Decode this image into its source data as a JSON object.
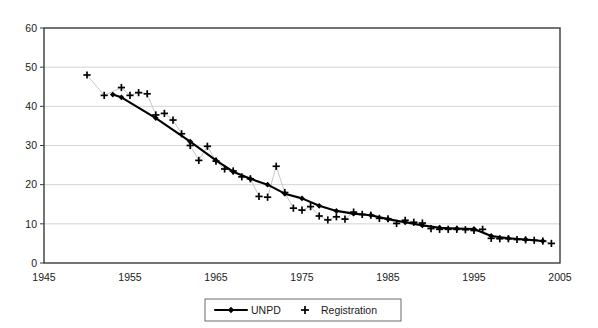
{
  "chart_data": {
    "type": "line",
    "title": "",
    "subtitle": "",
    "xlabel": "",
    "ylabel": "",
    "xlim": [
      1945,
      2005
    ],
    "ylim": [
      0,
      60
    ],
    "xticks": [
      1945,
      1955,
      1965,
      1975,
      1985,
      1995,
      2005
    ],
    "yticks": [
      0,
      10,
      20,
      30,
      40,
      50,
      60
    ],
    "grid": "horizontal",
    "legend_position": "bottom-center",
    "series": [
      {
        "name": "UNPD",
        "marker": "diamond",
        "line": "solid-black",
        "x": [
          1953,
          1954,
          1958,
          1962,
          1965,
          1967,
          1969,
          1971,
          1973,
          1975,
          1977,
          1979,
          1981,
          1983,
          1985,
          1987,
          1989,
          1991,
          1993,
          1995,
          1997,
          1999,
          2001,
          2003
        ],
        "values": [
          43.0,
          42.3,
          37.0,
          31.0,
          26.2,
          23.3,
          21.5,
          20.0,
          17.7,
          16.5,
          14.6,
          13.3,
          12.6,
          12.2,
          11.2,
          10.4,
          9.6,
          9.0,
          8.8,
          8.7,
          6.9,
          6.3,
          6.0,
          5.6
        ]
      },
      {
        "name": "Registration",
        "marker": "plus",
        "line": "thin-grey",
        "x": [
          1950,
          1952,
          1954,
          1955,
          1956,
          1957,
          1958,
          1959,
          1960,
          1961,
          1962,
          1963,
          1964,
          1965,
          1966,
          1967,
          1968,
          1969,
          1970,
          1971,
          1972,
          1973,
          1974,
          1975,
          1976,
          1977,
          1978,
          1979,
          1980,
          1981,
          1982,
          1983,
          1984,
          1985,
          1986,
          1987,
          1988,
          1989,
          1990,
          1991,
          1992,
          1993,
          1994,
          1995,
          1996,
          1997,
          1998,
          1999,
          2000,
          2001,
          2002,
          2003,
          2004
        ],
        "values": [
          48.0,
          42.8,
          44.8,
          42.8,
          43.5,
          43.2,
          37.8,
          38.2,
          36.5,
          33.0,
          30.0,
          26.2,
          29.8,
          26.0,
          24.0,
          23.5,
          22.0,
          21.5,
          17.0,
          16.8,
          24.7,
          18.0,
          14.0,
          13.5,
          14.4,
          12.0,
          11.0,
          11.8,
          11.2,
          13.0,
          12.4,
          12.2,
          11.4,
          11.3,
          10.1,
          10.9,
          10.4,
          10.2,
          8.8,
          8.6,
          8.6,
          8.6,
          8.5,
          8.3,
          8.6,
          6.3,
          6.2,
          6.2,
          6.0,
          5.9,
          5.8,
          5.6,
          5.0
        ]
      }
    ]
  },
  "legend": {
    "items": [
      {
        "label": "UNPD",
        "marker": "diamond-line"
      },
      {
        "label": "Registration",
        "marker": "plus"
      }
    ]
  },
  "colors": {
    "unpd": "#000000",
    "registration_marker": "#000000",
    "registration_line": "#b9b9b9",
    "grid": "#c9c9c9",
    "frame": "#3a3a3a",
    "background": "#ffffff"
  }
}
